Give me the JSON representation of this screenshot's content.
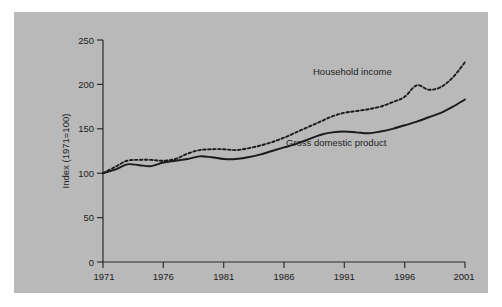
{
  "chart_data": {
    "type": "line",
    "title": "",
    "subtitle": "",
    "xlabel": "",
    "ylabel": "Index (1971=100)",
    "xlim": [
      1971,
      2001
    ],
    "ylim": [
      0,
      250
    ],
    "grid": false,
    "legend_position": "inline-annotation",
    "x_ticks": [
      "1971",
      "1976",
      "1981",
      "1986",
      "1991",
      "1996",
      "2001"
    ],
    "x_tick_values": [
      1971,
      1976,
      1981,
      1986,
      1991,
      1996,
      2001
    ],
    "y_ticks": [
      "0",
      "50",
      "100",
      "150",
      "200",
      "250"
    ],
    "y_tick_values": [
      0,
      50,
      100,
      150,
      200,
      250
    ],
    "x": [
      1971,
      1972,
      1973,
      1974,
      1975,
      1976,
      1977,
      1978,
      1979,
      1980,
      1981,
      1982,
      1983,
      1984,
      1985,
      1986,
      1987,
      1988,
      1989,
      1990,
      1991,
      1992,
      1993,
      1994,
      1995,
      1996,
      1997,
      1998,
      1999,
      2000,
      2001
    ],
    "series": [
      {
        "name": "Household income",
        "style": "dotted",
        "color": "#1a1a1a",
        "values": [
          100,
          107,
          114,
          115,
          115,
          114,
          116,
          122,
          126,
          127,
          127,
          126,
          128,
          131,
          135,
          140,
          146,
          152,
          158,
          164,
          168,
          170,
          172,
          175,
          180,
          186,
          199,
          194,
          197,
          208,
          225
        ]
      },
      {
        "name": "Gross domestic product",
        "style": "solid",
        "color": "#1a1a1a",
        "values": [
          100,
          104,
          110,
          109,
          108,
          112,
          114,
          116,
          119,
          118,
          116,
          116,
          118,
          121,
          125,
          129,
          133,
          138,
          143,
          146,
          147,
          146,
          145,
          147,
          150,
          154,
          158,
          163,
          168,
          175,
          183
        ]
      }
    ],
    "annotations": [
      {
        "name": "household-income-label",
        "text": "Household income",
        "x": 1992.6,
        "y": 212
      },
      {
        "name": "gross-domestic-product-label",
        "text": "Gross domestic product",
        "x": 1986.2,
        "y": 140
      }
    ],
    "colors": {
      "panel_background": "#b9b9b9",
      "page_background": "#ffffff",
      "axis": "#2b2b2b",
      "text": "#1d1d1d",
      "series": "#1a1a1a"
    }
  }
}
